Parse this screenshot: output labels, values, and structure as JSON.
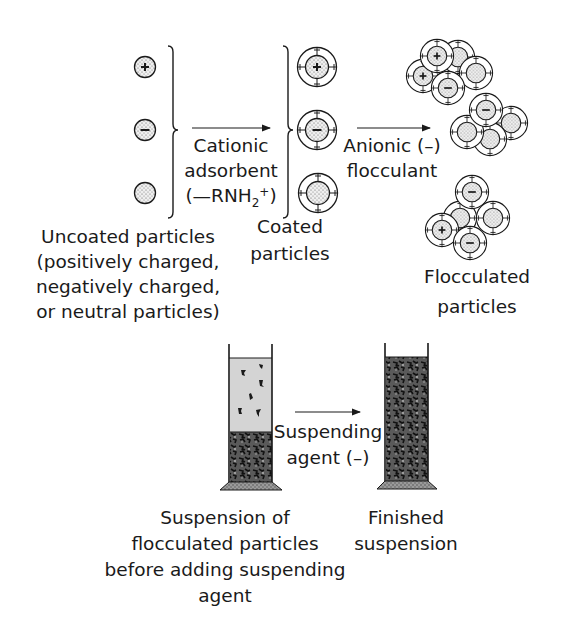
{
  "colors": {
    "ink": "#1a1a1a",
    "particle_fill": "#e6e6e6",
    "coat_fill": "#ffffff",
    "clear_liquid": "#d2d2d2",
    "sediment": "#3a3a3a",
    "base": "#8a8a8a",
    "background": "#ffffff"
  },
  "top_section": {
    "uncoated": {
      "particles": [
        {
          "charge": "+",
          "label": "positively charged particle"
        },
        {
          "charge": "-",
          "label": "negatively charged particle"
        },
        {
          "charge": "0",
          "label": "neutral particle"
        }
      ],
      "caption_lines": [
        "Uncoated particles",
        "(positively charged,",
        "negatively charged,",
        "or neutral particles)"
      ]
    },
    "step1": {
      "arrow": "right-arrow",
      "lines": [
        "Cationic",
        "adsorbent"
      ],
      "formula_prefix": "(—RNH",
      "formula_sub": "2",
      "formula_sup": "+",
      "formula_suffix": ")"
    },
    "coated": {
      "particles": [
        {
          "charge": "+"
        },
        {
          "charge": "-"
        },
        {
          "charge": "0"
        }
      ],
      "caption_lines": [
        "Coated",
        "particles"
      ]
    },
    "step2": {
      "arrow": "right-arrow",
      "lines": [
        "Anionic (–)",
        "flocculant"
      ]
    },
    "flocculated": {
      "caption_lines": [
        "Flocculated",
        "particles"
      ]
    }
  },
  "bottom_section": {
    "left_cylinder": {
      "caption_lines": [
        "Suspension of",
        "flocculated particles",
        "before adding suspending",
        "agent"
      ]
    },
    "step3": {
      "arrow": "right-arrow",
      "lines": [
        "Suspending",
        "agent (–)"
      ]
    },
    "right_cylinder": {
      "caption_lines": [
        "Finished",
        "suspension"
      ]
    }
  }
}
